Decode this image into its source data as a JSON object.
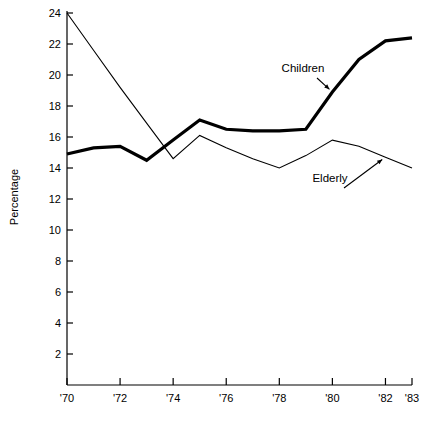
{
  "chart_data": {
    "type": "line",
    "title": "",
    "subtitle": "",
    "xlabel": "",
    "ylabel": "Percentage",
    "x": [
      1970,
      1971,
      1972,
      1973,
      1974,
      1975,
      1976,
      1977,
      1978,
      1979,
      1980,
      1981,
      1982,
      1983
    ],
    "xtick_values": [
      1970,
      1972,
      1974,
      1976,
      1978,
      1980,
      1982,
      1983
    ],
    "xtick_labels": [
      "'70",
      "'72",
      "'74",
      "'76",
      "'78",
      "'80",
      "'82",
      "'83"
    ],
    "ytick_values": [
      2,
      4,
      6,
      8,
      10,
      12,
      14,
      16,
      18,
      20,
      22,
      24
    ],
    "ytick_labels": [
      "2",
      "4",
      "6",
      "8",
      "10",
      "12",
      "14",
      "16",
      "18",
      "20",
      "22",
      "24"
    ],
    "xlim": [
      1970,
      1983
    ],
    "ylim": [
      0,
      24
    ],
    "grid": false,
    "legend_position": "inline-annotation",
    "series": [
      {
        "name": "Children",
        "style": "thick",
        "color": "#000000",
        "linewidth": 3.2,
        "values": [
          14.9,
          15.3,
          15.4,
          14.5,
          15.8,
          17.1,
          16.5,
          16.4,
          16.4,
          16.5,
          18.9,
          21.0,
          22.2,
          22.4
        ]
      },
      {
        "name": "Elderly",
        "style": "thin",
        "color": "#000000",
        "linewidth": 1.1,
        "values": [
          24.0,
          21.6,
          19.2,
          16.9,
          14.6,
          16.1,
          15.3,
          14.6,
          14.0,
          14.8,
          15.8,
          15.4,
          14.7,
          14.0
        ]
      }
    ],
    "annotations": [
      {
        "text": "Children",
        "target_series": "Children",
        "label_x": 303,
        "label_y": 72
      },
      {
        "text": "Elderly",
        "target_series": "Elderly",
        "label_x": 330,
        "label_y": 182
      }
    ]
  },
  "axis": {
    "y_title": "Percentage"
  }
}
